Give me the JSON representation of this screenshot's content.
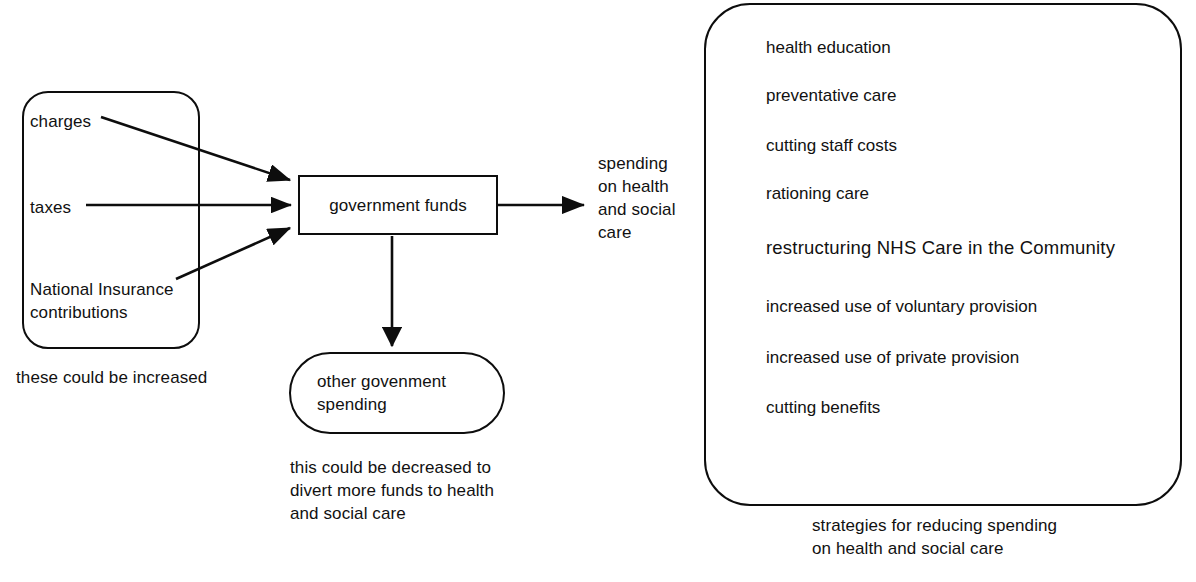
{
  "diagram": {
    "inputs_group": {
      "name": "sources of government funds",
      "items": [
        {
          "id": "charges",
          "label": "charges"
        },
        {
          "id": "taxes",
          "label": "taxes"
        },
        {
          "id": "national-insurance",
          "label": "National Insurance\ncontributions"
        }
      ],
      "caption": "these could be increased"
    },
    "central_node": {
      "label": "government funds"
    },
    "outflow": {
      "label": "spending\non health\nand social\ncare"
    },
    "other_spending": {
      "label": "other govenment\nspending",
      "caption": "this could be decreased to\ndivert more funds to health\nand social care"
    },
    "strategies_panel": {
      "caption": "strategies for reducing spending\non health and social care",
      "items": [
        {
          "label": "health education",
          "top": 37,
          "emphasis": false
        },
        {
          "label": "preventative care",
          "top": 85,
          "emphasis": false
        },
        {
          "label": "cutting staff costs",
          "top": 135,
          "emphasis": false
        },
        {
          "label": "rationing care",
          "top": 183,
          "emphasis": false
        },
        {
          "label": "restructuring NHS Care in the Community",
          "top": 237,
          "emphasis": true
        },
        {
          "label": "increased use of voluntary provision",
          "top": 296,
          "emphasis": false
        },
        {
          "label": "increased use of private provision",
          "top": 347,
          "emphasis": false
        },
        {
          "label": "cutting benefits",
          "top": 397,
          "emphasis": false
        }
      ]
    },
    "connectors": [
      {
        "id": "charges-to-funds",
        "from": "charges",
        "to": "government funds"
      },
      {
        "id": "taxes-to-funds",
        "from": "taxes",
        "to": "government funds"
      },
      {
        "id": "ni-to-funds",
        "from": "National Insurance",
        "to": "government funds"
      },
      {
        "id": "funds-to-spending",
        "from": "government funds",
        "to": "spending on health and social care"
      },
      {
        "id": "funds-to-other",
        "from": "government funds",
        "to": "other govenment spending"
      }
    ],
    "colors": {
      "background": "#ffffff",
      "ink": "#111111",
      "stroke": "#0d0d0d"
    }
  }
}
